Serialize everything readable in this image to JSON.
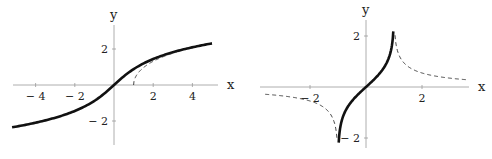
{
  "chart_data": [
    {
      "type": "line",
      "title": "",
      "xlabel": "x",
      "ylabel": "y",
      "xlim": [
        -5.2,
        5.2
      ],
      "ylim": [
        -3.2,
        3.2
      ],
      "x_ticks": [
        "-4",
        "-2",
        "2",
        "4"
      ],
      "y_ticks": [
        "2",
        "-2"
      ],
      "grid": false,
      "series": [
        {
          "name": "arcsinh(x)",
          "style": "solid",
          "x": [
            -5,
            -4,
            -3,
            -2,
            -1,
            0,
            1,
            2,
            3,
            4,
            5
          ],
          "y": [
            -2.31,
            -2.09,
            -1.82,
            -1.44,
            -0.88,
            0,
            0.88,
            1.44,
            1.82,
            2.09,
            2.31
          ]
        },
        {
          "name": "arccosh(x)",
          "style": "dashed",
          "x": [
            1,
            1.2,
            1.5,
            2,
            2.5,
            3
          ],
          "y": [
            0,
            0.62,
            0.96,
            1.32,
            1.57,
            1.76
          ]
        }
      ]
    },
    {
      "type": "line",
      "title": "",
      "xlabel": "x",
      "ylabel": "y",
      "xlim": [
        -3.8,
        3.7
      ],
      "ylim": [
        -2.2,
        2.3
      ],
      "x_ticks": [
        "-2",
        "2"
      ],
      "y_ticks": [
        "2",
        "-2"
      ],
      "grid": false,
      "series": [
        {
          "name": "arctanh(x)",
          "style": "solid",
          "x": [
            -0.96,
            -0.8,
            -0.5,
            0,
            0.5,
            0.8,
            0.96
          ],
          "y": [
            -1.95,
            -1.1,
            -0.55,
            0,
            0.55,
            1.1,
            1.95
          ]
        },
        {
          "name": "arccoth(x), x>1",
          "style": "dashed",
          "x": [
            1.04,
            1.2,
            1.5,
            2,
            2.5,
            3,
            3.5
          ],
          "y": [
            1.95,
            1.2,
            0.8,
            0.55,
            0.42,
            0.35,
            0.29
          ]
        },
        {
          "name": "arccoth(x), x<-1",
          "style": "dashed",
          "x": [
            -3.5,
            -3,
            -2.5,
            -2,
            -1.5,
            -1.2,
            -1.04
          ],
          "y": [
            -0.29,
            -0.35,
            -0.42,
            -0.55,
            -0.8,
            -1.2,
            -1.95
          ]
        }
      ]
    }
  ]
}
